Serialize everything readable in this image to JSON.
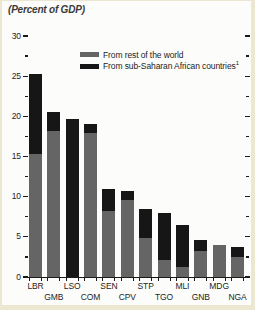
{
  "colors": {
    "background": "#ece7d1",
    "panel": "#fcfcfa",
    "bar_rest_of_world": "#656565",
    "bar_sub_saharan": "#161616",
    "axis": "#1a1a1a",
    "text": "#1d1d1d"
  },
  "legend_footnote": "1",
  "chart_data": {
    "type": "bar",
    "stacked": true,
    "title": "(Percent of GDP)",
    "categories": [
      "LBR",
      "GMB",
      "LSO",
      "COM",
      "SEN",
      "CPV",
      "STP",
      "TGO",
      "MLI",
      "GNB",
      "MDG",
      "NGA"
    ],
    "series": [
      {
        "name": "From rest of the world",
        "color": "#656565",
        "values": [
          15.3,
          18.2,
          0,
          17.9,
          8.2,
          9.6,
          4.8,
          2.1,
          1.2,
          3.2,
          4.0,
          2.5
        ]
      },
      {
        "name": "From sub-Saharan African countries",
        "color": "#161616",
        "values": [
          10.0,
          2.3,
          19.7,
          1.2,
          2.8,
          1.1,
          3.7,
          5.9,
          5.3,
          1.4,
          0,
          1.2
        ]
      }
    ],
    "ylim": [
      0,
      30
    ],
    "ytick_major": 5,
    "ytick_minor": 2.5,
    "yticks": [
      0,
      5,
      10,
      15,
      20,
      25,
      30
    ],
    "xlabel_stagger": "two-rows",
    "legend_position": "top-center",
    "grid": false
  }
}
